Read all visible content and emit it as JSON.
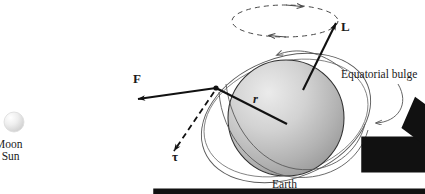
{
  "figure": {
    "width": 425,
    "height": 194,
    "background": "#ffffff"
  },
  "labels": {
    "angular_momentum": "L",
    "force": "F",
    "torque": "τ",
    "radius": "r",
    "equatorial_bulge": "Equatorial bulge",
    "earth": "Earth",
    "moon": "Moon",
    "sun": "r Sun"
  },
  "bodies": {
    "earth": {
      "name": "Earth",
      "center_x": 286,
      "center_y": 118,
      "radius": 58,
      "fill_light": "#e2e2e2",
      "fill_dark": "#9a9a9a",
      "stroke": "#2b2b2b"
    },
    "moon_or_sun": {
      "name": "Moon or Sun",
      "center_x": 14,
      "center_y": 122,
      "radius": 10,
      "fill_light": "#fbfbfb",
      "fill_dark": "#cfcfcf",
      "stroke": "#d8d8d8"
    }
  },
  "vectors": {
    "L": {
      "label": "L",
      "style": "solid",
      "from_x": 303,
      "from_y": 90,
      "to_x": 336,
      "to_y": 22,
      "color": "#111111"
    },
    "F": {
      "label": "F",
      "style": "solid",
      "from_x": 216,
      "from_y": 88,
      "to_x": 137,
      "to_y": 99,
      "color": "#111111"
    },
    "r": {
      "label": "r",
      "style": "solid",
      "from_x": 216,
      "from_y": 88,
      "to_x": 287,
      "to_y": 124,
      "color": "#111111"
    },
    "tau": {
      "label": "τ",
      "style": "dashed",
      "from_x": 216,
      "from_y": 88,
      "to_x": 172,
      "to_y": 152,
      "color": "#111111"
    }
  },
  "precession": {
    "style": "dashed",
    "center_x": 285,
    "center_y": 21,
    "rx": 53,
    "ry": 16,
    "direction_top": "right",
    "direction_bottom": "left",
    "color": "#4a4a4a"
  },
  "equatorial_bulge": {
    "label": "Equatorial bulge",
    "outline_color": "#555555",
    "tilt_degrees": -22,
    "leader_arrow_top": {
      "to_x": 275,
      "to_y": 57
    },
    "leader_arrow_right": {
      "to_x": 371,
      "to_y": 123
    }
  },
  "colors": {
    "ink": "#111111",
    "outline": "#555555",
    "earth_fill": "#c8c8c8"
  }
}
